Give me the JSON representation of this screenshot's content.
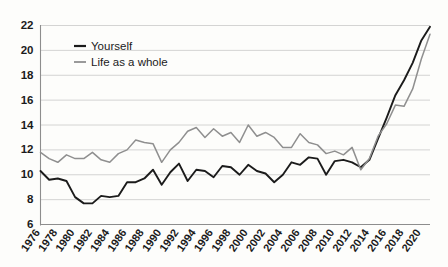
{
  "chart_data": {
    "type": "line",
    "title": "",
    "subtitle": "",
    "xlabel": "",
    "ylabel": "",
    "xlim": [
      1976,
      2021
    ],
    "ylim": [
      6,
      22
    ],
    "yticks": [
      6,
      8,
      10,
      12,
      14,
      16,
      18,
      20,
      22
    ],
    "grid": true,
    "legend_position": "top-left",
    "legend": [
      "Yourself",
      "Life as a whole"
    ],
    "colors": {
      "yourself": "#1b1b1b",
      "life_as_a_whole": "#8f8f8f",
      "grid": "#c9c9c9",
      "axis": "#8d8d8d",
      "background": "#fdfdfb"
    },
    "x": [
      1976,
      1977,
      1978,
      1979,
      1980,
      1981,
      1982,
      1983,
      1984,
      1985,
      1986,
      1987,
      1988,
      1989,
      1990,
      1991,
      1992,
      1993,
      1994,
      1995,
      1996,
      1997,
      1998,
      1999,
      2000,
      2001,
      2002,
      2003,
      2004,
      2005,
      2006,
      2007,
      2008,
      2009,
      2010,
      2011,
      2012,
      2013,
      2014,
      2015,
      2016,
      2017,
      2018,
      2019,
      2020,
      2021
    ],
    "xtick_labels": [
      "1976",
      "1978",
      "1980",
      "1982",
      "1984",
      "1986",
      "1988",
      "1990",
      "1992",
      "1994",
      "1996",
      "1998",
      "2000",
      "2002",
      "2004",
      "2006",
      "2008",
      "2010",
      "2012",
      "2014",
      "2016",
      "2018",
      "2020"
    ],
    "xtick_values": [
      1976,
      1978,
      1980,
      1982,
      1984,
      1986,
      1988,
      1990,
      1992,
      1994,
      1996,
      1998,
      2000,
      2002,
      2004,
      2006,
      2008,
      2010,
      2012,
      2014,
      2016,
      2018,
      2020
    ],
    "series": [
      {
        "name": "Yourself",
        "color": "#1b1b1b",
        "width": 1.9,
        "values": [
          10.3,
          9.6,
          9.7,
          9.5,
          8.2,
          7.7,
          7.7,
          8.3,
          8.2,
          8.3,
          9.4,
          9.4,
          9.7,
          10.4,
          9.2,
          10.2,
          10.9,
          9.5,
          10.4,
          10.3,
          9.8,
          10.7,
          10.6,
          10.0,
          10.8,
          10.3,
          10.1,
          9.4,
          10.0,
          11.0,
          10.8,
          11.4,
          11.3,
          10.0,
          11.1,
          11.2,
          11.0,
          10.6,
          11.2,
          12.9,
          14.6,
          16.4,
          17.6,
          19.0,
          20.8,
          21.9
        ]
      },
      {
        "name": "Life as a whole",
        "color": "#8f8f8f",
        "width": 1.5,
        "values": [
          11.8,
          11.3,
          11.0,
          11.6,
          11.3,
          11.3,
          11.8,
          11.2,
          11.0,
          11.7,
          12.0,
          12.8,
          12.6,
          12.5,
          11.0,
          12.0,
          12.6,
          13.5,
          13.8,
          13.0,
          13.7,
          13.1,
          13.4,
          12.6,
          14.0,
          13.1,
          13.4,
          13.0,
          12.2,
          12.2,
          13.3,
          12.6,
          12.4,
          11.7,
          11.9,
          11.6,
          12.2,
          10.4,
          11.3,
          13.1,
          14.1,
          15.6,
          15.5,
          16.9,
          19.3,
          21.3
        ]
      }
    ]
  }
}
